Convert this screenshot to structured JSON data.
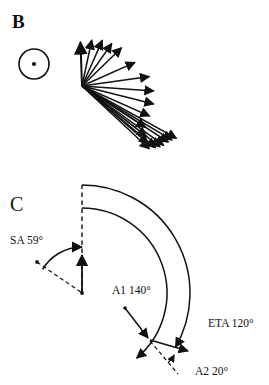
{
  "figure": {
    "width": 269,
    "height": 385,
    "background": "#ffffff",
    "ink": "#111111"
  },
  "panels": {
    "b": {
      "letter": "B",
      "symbol": {
        "name": "out-of-page-vector-symbol",
        "cx": 34,
        "cy": 64,
        "r": 15,
        "dot_r": 2.1
      },
      "vector_fan": {
        "origin_x": 82,
        "origin_y": 86,
        "description": "radiating arrow fan",
        "arrows": [
          {
            "angle_deg": 92,
            "length": 44
          },
          {
            "angle_deg": 78,
            "length": 47
          },
          {
            "angle_deg": 66,
            "length": 50
          },
          {
            "angle_deg": 55,
            "length": 52
          },
          {
            "angle_deg": 44,
            "length": 55
          },
          {
            "angle_deg": 24,
            "length": 58
          },
          {
            "angle_deg": 8,
            "length": 68
          },
          {
            "angle_deg": -4,
            "length": 72
          },
          {
            "angle_deg": -14,
            "length": 74
          },
          {
            "angle_deg": -24,
            "length": 74
          },
          {
            "angle_deg": -33,
            "length": 76
          },
          {
            "angle_deg": -38,
            "length": 82
          },
          {
            "angle_deg": -41,
            "length": 88
          },
          {
            "angle_deg": -43,
            "length": 92
          },
          {
            "angle_deg": -40,
            "length": 96
          },
          {
            "angle_deg": -38,
            "length": 99
          },
          {
            "angle_deg": -36,
            "length": 101
          },
          {
            "angle_deg": -33,
            "length": 103
          },
          {
            "angle_deg": -31,
            "length": 105
          },
          {
            "angle_deg": -29,
            "length": 108
          }
        ]
      }
    },
    "c": {
      "letter": "C",
      "center_x": 82,
      "center_y": 293,
      "arcs": {
        "outer": {
          "name": "eta-arc",
          "radius": 108,
          "start_angle_deg": 90,
          "end_angle_deg": -30
        },
        "inner": {
          "name": "a1-arc",
          "radius": 85,
          "start_angle_deg": 90,
          "end_angle_deg": -50
        },
        "sa": {
          "name": "sa-arc",
          "radius": 46,
          "start_angle_deg": 149,
          "end_angle_deg": 90
        },
        "a2": {
          "name": "a2-arc",
          "radius": 28,
          "start_angle_deg": -50,
          "end_angle_deg": -30
        }
      },
      "labels": {
        "sa": "SA 59°",
        "a1": "A1 140°",
        "eta": "ETA 120°",
        "a2": "A2 20°"
      },
      "values": {
        "sa_deg": 59,
        "a1_deg": 140,
        "eta_deg": 120,
        "a2_deg": 20
      }
    }
  }
}
